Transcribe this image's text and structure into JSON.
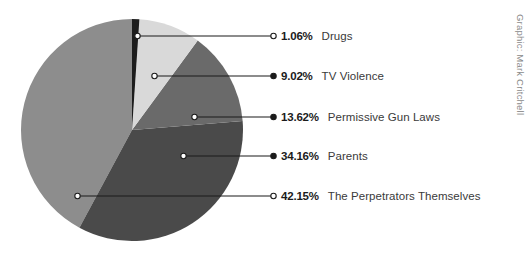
{
  "chart_data": {
    "type": "pie",
    "title": "",
    "subtitle": "",
    "xlabel": "",
    "ylabel": "",
    "legend_position": "right-callout-labels",
    "grid": false,
    "categories": [
      "Drugs",
      "TV Violence",
      "Permissive Gun Laws",
      "Parents",
      "The Perpetrators Themselves"
    ],
    "values": [
      1.06,
      9.02,
      13.62,
      34.16,
      42.15
    ],
    "value_labels": [
      "1.06%",
      "9.02%",
      "13.62%",
      "34.16%",
      "42.15%"
    ],
    "units": "percent",
    "total": 100.01,
    "slices": [
      {
        "label": "Drugs",
        "value": 1.06,
        "value_label": "1.06%",
        "color": "#1d1d1d"
      },
      {
        "label": "TV Violence",
        "value": 9.02,
        "value_label": "9.02%",
        "color": "#d9d9d9"
      },
      {
        "label": "Permissive Gun Laws",
        "value": 13.62,
        "value_label": "13.62%",
        "color": "#6a6a6a"
      },
      {
        "label": "Parents",
        "value": 34.16,
        "value_label": "34.16%",
        "color": "#4a4a4a"
      },
      {
        "label": "The Perpetrators Themselves",
        "value": 42.15,
        "value_label": "42.15%",
        "color": "#8d8d8d"
      }
    ]
  },
  "credit": {
    "text": "Graphic: Mark Critchell"
  },
  "colors": {
    "background": "#ffffff",
    "leader_line": "#1b1b1b",
    "percent_text": "#1b1b1b",
    "label_text": "#3a3a3a",
    "credit_text": "#8a8a8a"
  }
}
